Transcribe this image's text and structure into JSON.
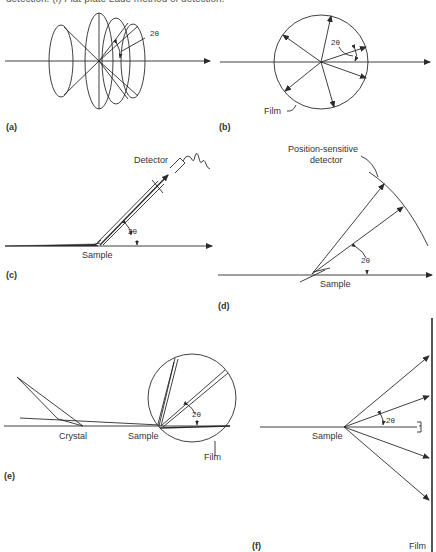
{
  "caption": "detection. (f) Flat-plate Laue method of detection.",
  "panels": {
    "a": {
      "label": "(a)",
      "angle": "2θ"
    },
    "b": {
      "label": "(b)",
      "angle": "2θ",
      "film": "Film"
    },
    "c": {
      "label": "(c)",
      "angle": "2θ",
      "detector": "Detector",
      "sample": "Sample"
    },
    "d": {
      "label": "(d)",
      "angle": "2θ",
      "detector_line1": "Position-sensitive",
      "detector_line2": "detector",
      "sample": "Sample"
    },
    "e": {
      "label": "(e)",
      "angle": "2θ",
      "crystal": "Crystal",
      "sample": "Sample",
      "film": "Film"
    },
    "f": {
      "label": "(f)",
      "angle": "2θ",
      "sample": "Sample",
      "film": "Film"
    }
  },
  "colors": {
    "line": "#2b2b2b",
    "text": "#333333"
  }
}
